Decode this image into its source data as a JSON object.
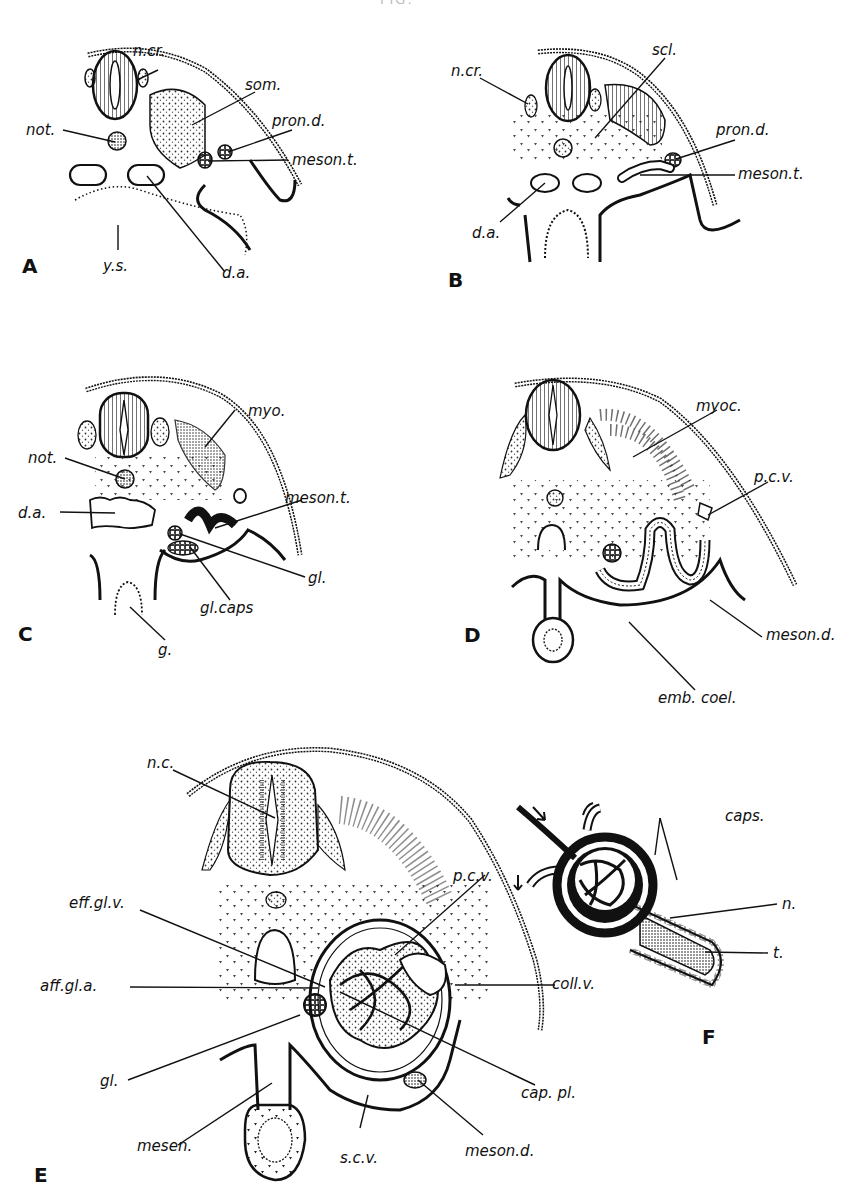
{
  "figure": {
    "title_fragment": "FIG.",
    "panels": [
      {
        "id": "A",
        "letter": "A",
        "labels": [
          "n.cr.",
          "som.",
          "not.",
          "pron.d.",
          "meson.t.",
          "y.s.",
          "d.a."
        ]
      },
      {
        "id": "B",
        "letter": "B",
        "labels": [
          "n.cr.",
          "scl.",
          "pron.d.",
          "meson.t.",
          "d.a."
        ]
      },
      {
        "id": "C",
        "letter": "C",
        "labels": [
          "myo.",
          "not.",
          "d.a.",
          "meson.t.",
          "gl.",
          "gl.caps",
          "g."
        ]
      },
      {
        "id": "D",
        "letter": "D",
        "labels": [
          "myoc.",
          "p.c.v.",
          "meson.d.",
          "emb.coel."
        ]
      },
      {
        "id": "E",
        "letter": "E",
        "labels": [
          "n.c.",
          "p.c.v.",
          "eff.gl.v.",
          "aff.gl.a.",
          "coll.v.",
          "gl.",
          "cap.pl.",
          "mesen.",
          "s.c.v.",
          "meson.d."
        ]
      },
      {
        "id": "F",
        "letter": "F",
        "labels": [
          "caps.",
          "n.",
          "t."
        ]
      }
    ]
  },
  "A": {
    "letter": "A",
    "ncr": "n.cr.",
    "som": "som.",
    "not": "not.",
    "prond": "pron.d.",
    "mesont": "meson.t.",
    "ys": "y.s.",
    "da": "d.a."
  },
  "B": {
    "letter": "B",
    "ncr": "n.cr.",
    "scl": "scl.",
    "prond": "pron.d.",
    "mesont": "meson.t.",
    "da": "d.a."
  },
  "C": {
    "letter": "C",
    "myo": "myo.",
    "not": "not.",
    "da": "d.a.",
    "mesont": "meson.t.",
    "gl": "gl.",
    "glcaps": "gl.caps",
    "g": "g."
  },
  "D": {
    "letter": "D",
    "myoc": "myoc.",
    "pcv": "p.c.v.",
    "mesond": "meson.d.",
    "embcoel": "emb. coel."
  },
  "E": {
    "letter": "E",
    "nc": "n.c.",
    "pcv": "p.c.v.",
    "effglv": "eff.gl.v.",
    "affgla": "aff.gl.a.",
    "collv": "coll.v.",
    "gl": "gl.",
    "cappl": "cap. pl.",
    "mesen": "mesen.",
    "scv": "s.c.v.",
    "mesond": "meson.d."
  },
  "F": {
    "letter": "F",
    "caps": "caps.",
    "n": "n.",
    "t": "t."
  },
  "colors": {
    "ink": "#111111",
    "paper": "#ffffff",
    "stipple": "#444444"
  }
}
